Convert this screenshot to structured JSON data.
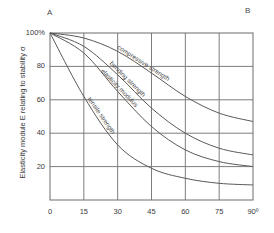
{
  "figure": {
    "corner_markers": {
      "left": "A",
      "right": "B"
    }
  },
  "chart_data": {
    "type": "line",
    "title": "",
    "subtitle": "",
    "xlabel": "",
    "ylabel": "Elasticity module E relating to stability σ",
    "x": [
      0,
      15,
      30,
      45,
      60,
      75,
      90
    ],
    "xtick_labels": [
      "0",
      "15",
      "30",
      "45",
      "60",
      "75",
      "90º"
    ],
    "ytick_labels": [
      "100%",
      "80",
      "60",
      "40",
      "20"
    ],
    "ytick_values": [
      100,
      80,
      60,
      40,
      20
    ],
    "xlim": [
      0,
      90
    ],
    "ylim": [
      0,
      100
    ],
    "grid": true,
    "legend": "inline-curve-labels",
    "axis_note": "x axis is angle of grain in degrees; y axis is percentage of property retained",
    "series": [
      {
        "name": "compressive strength",
        "label": "compressive strength",
        "values": [
          100,
          97,
          89,
          76,
          62,
          52,
          47
        ],
        "color": "#595959"
      },
      {
        "name": "bending strength",
        "label": "bending strength",
        "values": [
          100,
          92,
          75,
          55,
          40,
          31,
          27
        ],
        "color": "#595959"
      },
      {
        "name": "elasticity modulus",
        "label": "elasticity modulus",
        "values": [
          100,
          88,
          65,
          44,
          30,
          23,
          20
        ],
        "color": "#595959"
      },
      {
        "name": "tensile strength",
        "label": "tensile strength",
        "values": [
          100,
          62,
          33,
          19,
          13,
          10,
          9
        ],
        "color": "#595959"
      }
    ]
  }
}
